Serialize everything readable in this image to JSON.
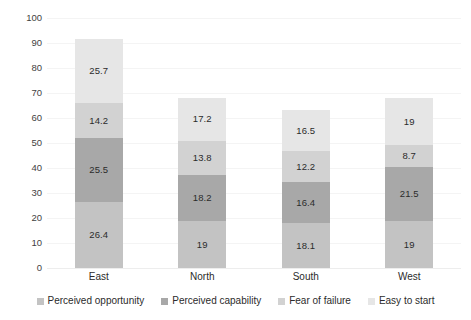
{
  "chart_data": {
    "type": "bar",
    "stacked": true,
    "title": "",
    "subtitle": "",
    "xlabel": "",
    "ylabel": "",
    "ylim": [
      0,
      100
    ],
    "ytick_labels": [
      "100",
      "90",
      "80",
      "70",
      "60",
      "50",
      "40",
      "30",
      "20",
      "10",
      "0"
    ],
    "ytick_values": [
      100,
      90,
      80,
      70,
      60,
      50,
      40,
      30,
      20,
      10,
      0
    ],
    "grid": true,
    "legend_position": "bottom",
    "categories": [
      "East",
      "North",
      "South",
      "West"
    ],
    "series": [
      {
        "name": "Perceived opportunity",
        "color": "#c3c3c3",
        "values": [
          26.4,
          19,
          18.1,
          19
        ],
        "labels": [
          "26.4",
          "19",
          "18.1",
          "19"
        ]
      },
      {
        "name": "Perceived capability",
        "color": "#a8a8a8",
        "values": [
          25.5,
          18.2,
          16.4,
          21.5
        ],
        "labels": [
          "25.5",
          "18.2",
          "16.4",
          "21.5"
        ]
      },
      {
        "name": "Fear of failure",
        "color": "#d2d2d2",
        "values": [
          14.2,
          13.8,
          12.2,
          8.7
        ],
        "labels": [
          "14.2",
          "13.8",
          "12.2",
          "8.7"
        ]
      },
      {
        "name": "Easy to start",
        "color": "#e6e6e6",
        "values": [
          25.7,
          17.2,
          16.5,
          19
        ],
        "labels": [
          "25.7",
          "17.2",
          "16.5",
          "19"
        ]
      }
    ],
    "totals": [
      91.8,
      68.2,
      63.2,
      68.2
    ]
  }
}
